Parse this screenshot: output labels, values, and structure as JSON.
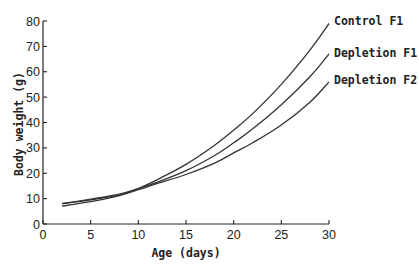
{
  "chart_data": {
    "type": "line",
    "title": "",
    "xlabel": "Age (days)",
    "ylabel": "Body weight (g)",
    "xlim": [
      0,
      30
    ],
    "ylim": [
      0,
      80
    ],
    "xticks": [
      0,
      5,
      10,
      15,
      20,
      25,
      30
    ],
    "yticks": [
      0,
      10,
      20,
      30,
      40,
      50,
      60,
      70,
      80
    ],
    "grid": false,
    "legend": "inline labels at right end of curves",
    "x": [
      2,
      5,
      8,
      10,
      12,
      15,
      18,
      20,
      22,
      25,
      28,
      30
    ],
    "series": [
      {
        "name": "Control F1",
        "values": [
          8,
          9.5,
          11.5,
          14,
          17.5,
          23.5,
          31,
          37,
          43.5,
          55,
          68.5,
          79
        ]
      },
      {
        "name": "Depletion F1",
        "values": [
          8,
          9.8,
          11.8,
          14,
          16.5,
          21,
          27,
          32,
          37.5,
          47,
          58,
          67
        ]
      },
      {
        "name": "Depletion F2",
        "values": [
          7,
          8.8,
          11.2,
          13.5,
          16,
          19.5,
          24,
          28,
          32,
          39,
          48,
          56
        ]
      }
    ]
  }
}
